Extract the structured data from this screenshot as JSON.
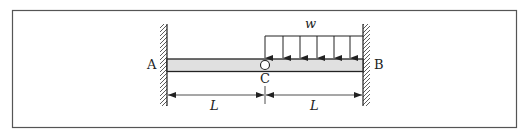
{
  "figure": {
    "frame_color": "#555555",
    "beam_fill": "#e0e0e0",
    "line_color": "#222222"
  },
  "labels": {
    "support_left": "A",
    "support_right": "B",
    "hinge": "C",
    "load": "w",
    "span_left": "L",
    "span_right": "L"
  },
  "elements": {
    "supports": [
      {
        "name": "A",
        "type": "fixed",
        "side": "left"
      },
      {
        "name": "B",
        "type": "fixed",
        "side": "right"
      }
    ],
    "hinge": {
      "name": "C",
      "type": "internal-hinge"
    },
    "distributed_load": {
      "symbol": "w",
      "from": "C",
      "to": "B",
      "arrow_count": 6
    },
    "dimensions": [
      {
        "from": "A",
        "to": "C",
        "label": "L"
      },
      {
        "from": "C",
        "to": "B",
        "label": "L"
      }
    ]
  }
}
